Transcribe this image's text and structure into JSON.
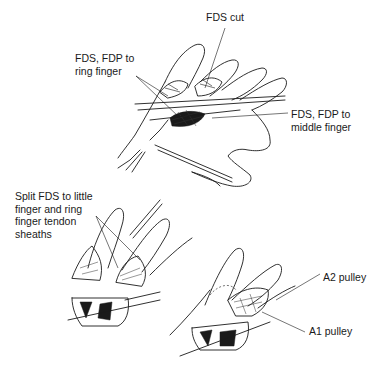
{
  "figure": {
    "panels": [
      {
        "id": "top",
        "description": "Palm-up hand with exposed flexor tendons, retractor and clamp",
        "labels": [
          {
            "text": "FDS cut",
            "x": 206,
            "y": 17
          },
          {
            "text": "FDS, FDP to\nring finger",
            "x": 75,
            "y": 47
          },
          {
            "text": "FDS, FDP to\nmiddle finger",
            "x": 290,
            "y": 108
          }
        ]
      },
      {
        "id": "bottom-left",
        "description": "Fingers with split FDS to little and ring finger tendon sheaths",
        "labels": [
          {
            "text": "Split FDS to little\nfinger and ring\nfinger tendon\nsheaths",
            "x": 15,
            "y": 190
          }
        ]
      },
      {
        "id": "bottom-right",
        "description": "Finger showing A1 and A2 pulleys",
        "labels": [
          {
            "text": "A2 pulley",
            "x": 322,
            "y": 269
          },
          {
            "text": "A1 pulley",
            "x": 308,
            "y": 328
          }
        ]
      }
    ]
  }
}
